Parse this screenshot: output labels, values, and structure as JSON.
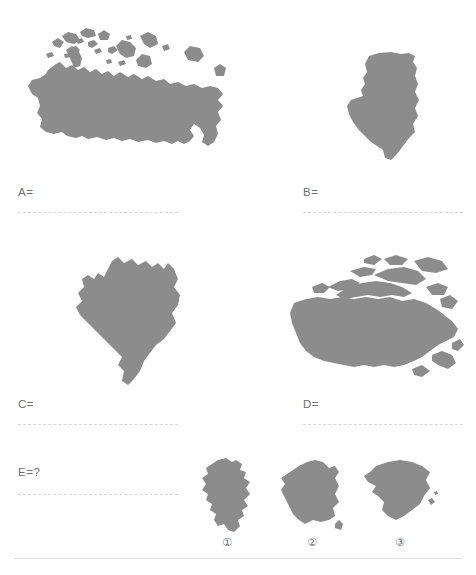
{
  "page": {
    "background_color": "#ffffff",
    "shape_color": "#8c8c8c",
    "label_color": "#6e6e6e",
    "line_color": "#d7d7d7",
    "rule_color": "#e2e2e2"
  },
  "questions": [
    {
      "key": "A",
      "label": "A=",
      "shape_name": "russia-silhouette"
    },
    {
      "key": "B",
      "label": "B=",
      "shape_name": "algeria-silhouette"
    },
    {
      "key": "C",
      "label": "C=",
      "shape_name": "brazil-silhouette"
    },
    {
      "key": "D",
      "label": "D=",
      "shape_name": "canada-silhouette"
    }
  ],
  "prompt": {
    "label": "E=?"
  },
  "options": [
    {
      "number": "①",
      "shape_name": "germany-silhouette"
    },
    {
      "number": "②",
      "shape_name": "france-silhouette"
    },
    {
      "number": "③",
      "shape_name": "spain-silhouette"
    }
  ]
}
